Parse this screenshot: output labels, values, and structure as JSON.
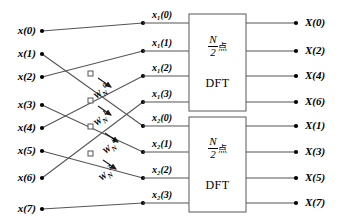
{
  "diagram": {
    "type": "signal-flow-graph",
    "line_color": "#555555",
    "node_color": "#000000",
    "box_border_color": "#666666"
  },
  "inputs": [
    {
      "label": "x(0)",
      "y": 31
    },
    {
      "label": "x(1)",
      "y": 54
    },
    {
      "label": "x(2)",
      "y": 77
    },
    {
      "label": "x(3)",
      "y": 105
    },
    {
      "label": "x(4)",
      "y": 128
    },
    {
      "label": "x(5)",
      "y": 151
    },
    {
      "label": "x(6)",
      "y": 178
    },
    {
      "label": "x(7)",
      "y": 209
    }
  ],
  "intermediate": [
    {
      "label": "x₁(0)",
      "y": 23
    },
    {
      "label": "x₁(1)",
      "y": 51
    },
    {
      "label": "x₁(2)",
      "y": 76
    },
    {
      "label": "x₁(3)",
      "y": 102
    },
    {
      "label": "x₂(0)",
      "y": 126
    },
    {
      "label": "x₂(1)",
      "y": 152
    },
    {
      "label": "x₂(2)",
      "y": 178
    },
    {
      "label": "x₂(3)",
      "y": 203
    }
  ],
  "blocks": [
    {
      "name": "upper-dft",
      "numerator": "N",
      "denominator": "2",
      "unit": "点",
      "operation": "DFT"
    },
    {
      "name": "lower-dft",
      "numerator": "N",
      "denominator": "2",
      "unit": "点",
      "operation": "DFT"
    }
  ],
  "outputs": [
    {
      "label": "X(0)",
      "y": 23
    },
    {
      "label": "X(2)",
      "y": 51
    },
    {
      "label": "X(4)",
      "y": 76
    },
    {
      "label": "X(6)",
      "y": 102
    },
    {
      "label": "X(1)",
      "y": 126
    },
    {
      "label": "X(3)",
      "y": 152
    },
    {
      "label": "X(5)",
      "y": 178
    },
    {
      "label": "X(7)",
      "y": 203
    }
  ],
  "twiddles": [
    {
      "base": "W",
      "sub": "N",
      "sup": "0",
      "x": 95,
      "y": 90
    },
    {
      "base": "W",
      "sub": "N",
      "sup": "1",
      "x": 95,
      "y": 117
    },
    {
      "base": "W",
      "sub": "N",
      "sup": "2",
      "x": 104,
      "y": 145
    },
    {
      "base": "W",
      "sub": "N",
      "sup": "3",
      "x": 100,
      "y": 172
    }
  ]
}
